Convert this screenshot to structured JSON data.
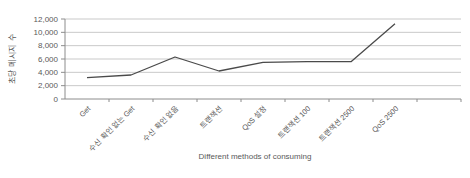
{
  "chart_data": {
    "type": "line",
    "title": "",
    "categories": [
      "Get",
      "수신 확인 없는 Get",
      "수신 확인 없음",
      "트랜잭션",
      "QoS 설정",
      "트랜잭션 100",
      "트랜잭션 2500",
      "QoS 2500"
    ],
    "values": [
      3200,
      3600,
      6300,
      4200,
      5500,
      5600,
      5600,
      11300
    ],
    "xlabel": "Different methods of consuming",
    "ylabel": "초당 메시지 수",
    "ylim": [
      0,
      12000
    ],
    "ytick_step": 2000,
    "ytick_labels": [
      "0",
      "2,000",
      "4,000",
      "6,000",
      "8,000",
      "10,000",
      "12,000"
    ],
    "grid": "horizontal",
    "legend": "none",
    "line_color": "#4a4a4a",
    "gridline_color": "#c9c9c9",
    "axis_color": "#8c8c8c",
    "text_color": "#595959",
    "background": "#ffffff"
  }
}
